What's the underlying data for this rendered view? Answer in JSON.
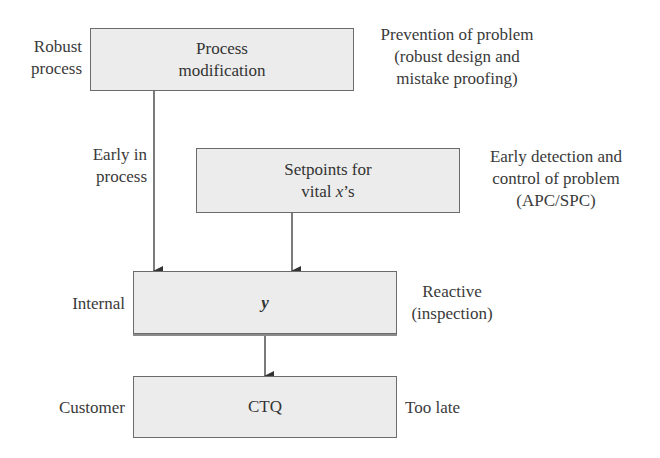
{
  "boxes": {
    "process_modification": {
      "lines": [
        "Process",
        "modification"
      ]
    },
    "setpoints": {
      "line1": "Setpoints for",
      "line2_prefix": "vital ",
      "line2_var": "x",
      "line2_suffix": "’s"
    },
    "y": {
      "label": "y"
    },
    "ctq": {
      "label": "CTQ"
    }
  },
  "left_labels": {
    "robust_process": [
      "Robust",
      "process"
    ],
    "early_in_process": [
      "Early in",
      "process"
    ],
    "internal": "Internal",
    "customer": "Customer"
  },
  "right_labels": {
    "prevention": [
      "Prevention of problem",
      "(robust design and",
      "mistake proofing)"
    ],
    "early_detection": [
      "Early detection and",
      "control of problem",
      "(APC/SPC)"
    ],
    "reactive": [
      "Reactive",
      "(inspection)"
    ],
    "too_late": "Too late"
  },
  "colors": {
    "box_fill": "#ececec",
    "box_border": "#6b6b6b",
    "arrow": "#333333",
    "text": "#3a3a3a"
  }
}
